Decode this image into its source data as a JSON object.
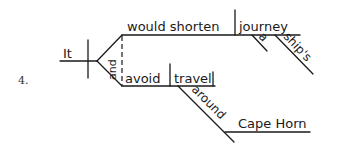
{
  "diagram": {
    "type": "sentence-diagram",
    "item_number": "4.",
    "subject": "It",
    "conjunction": "and",
    "predicate_upper": {
      "verb": "would shorten",
      "object": "journey",
      "modifiers": [
        "a",
        "ship's"
      ]
    },
    "predicate_lower": {
      "verb": "avoid",
      "object": "travel",
      "preposition": "around",
      "prep_object": "Cape Horn"
    }
  }
}
